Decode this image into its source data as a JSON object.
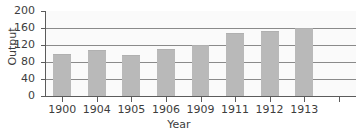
{
  "chart_data": {
    "type": "bar",
    "title": "",
    "subtitle": "",
    "xlabel": "Year",
    "ylabel": "Output",
    "categories": [
      "1900",
      "1904",
      "1905",
      "1906",
      "1909",
      "1911",
      "1912",
      "1913"
    ],
    "values": [
      100,
      108,
      96,
      110,
      120,
      148,
      152,
      161
    ],
    "series": [
      {
        "name": "Output",
        "values": [
          100,
          108,
          96,
          110,
          120,
          148,
          152,
          161
        ]
      }
    ],
    "ylim": [
      0,
      200
    ],
    "ytick_labels": [
      "0",
      "40",
      "80",
      "120",
      "160",
      "200"
    ],
    "ytick_values": [
      0,
      40,
      80,
      120,
      160,
      200
    ],
    "xtick_labels": [
      "1900",
      "1904",
      "1905",
      "1906",
      "1909",
      "1911",
      "1912",
      "1913",
      ""
    ],
    "grid": "horizontal",
    "legend": "none",
    "bar_color": "#b9b9b9",
    "grid_color": "#8a8a8a",
    "axis_color": "#5b5b5b",
    "plot_background": "#fafafa",
    "text_color": "#3d3d3d"
  }
}
